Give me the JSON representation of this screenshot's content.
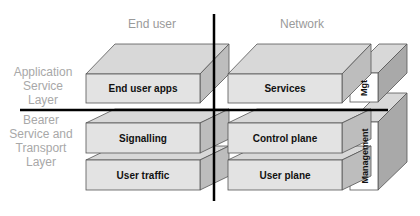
{
  "columns": {
    "end_user": "End user",
    "network": "Network"
  },
  "rows": {
    "application": [
      "Application",
      "Service",
      "Layer"
    ],
    "bearer": [
      "Bearer",
      "Service and",
      "Transport",
      "Layer"
    ]
  },
  "blocks": {
    "end_user_apps": "End user apps",
    "services": "Services",
    "mgt": "Mgt",
    "signalling": "Signalling",
    "control_plane": "Control plane",
    "user_traffic": "User traffic",
    "user_plane": "User plane",
    "management": "Management"
  },
  "colors": {
    "front": "#e2e2e2",
    "top": "#d6d6d6",
    "side": "#b8b8b8",
    "white_front": "#ffffff",
    "axis": "#000000",
    "header_text": "#9a9a9a"
  }
}
